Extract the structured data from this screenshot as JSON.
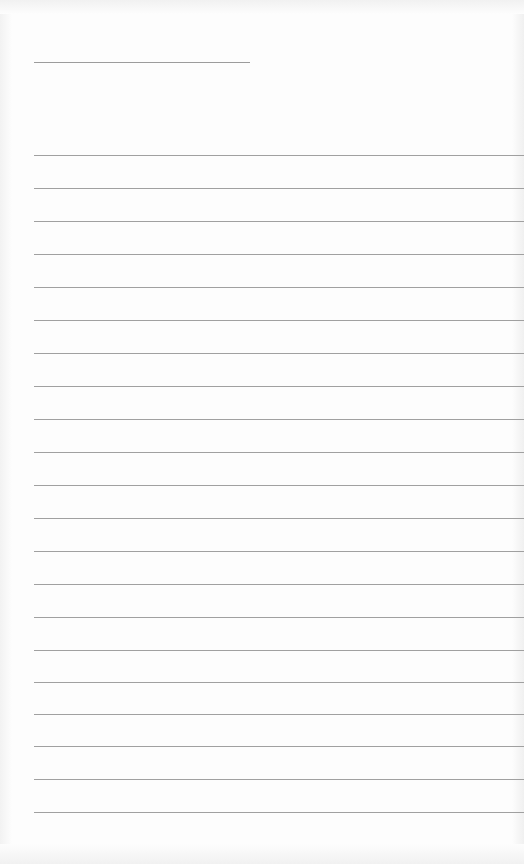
{
  "document": {
    "type": "blank lined sheet",
    "header_line": {
      "x": 34,
      "y": 62,
      "width": 216
    },
    "ruled_lines": {
      "count": 21,
      "x": 34,
      "width": 490,
      "positions_y": [
        155,
        188,
        221,
        254,
        287,
        320,
        353,
        386,
        419,
        452,
        485,
        518,
        551,
        584,
        617,
        650,
        682,
        714,
        746,
        779,
        812
      ]
    },
    "colors": {
      "background": "#fdfdfd",
      "line": "#a0a0a0"
    },
    "text_content": []
  }
}
